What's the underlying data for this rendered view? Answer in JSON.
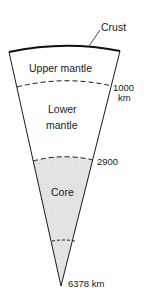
{
  "diagram": {
    "layers": [
      {
        "name": "Crust",
        "label": "Crust"
      },
      {
        "name": "Upper mantle",
        "label": "Upper mantle"
      },
      {
        "name": "Lower mantle",
        "label_line1": "Lower",
        "label_line2": "mantle"
      },
      {
        "name": "Core",
        "label": "Core"
      }
    ],
    "depths": {
      "d1000_value": "1000",
      "d1000_unit": "km",
      "d2900_value": "2900",
      "center_value": "6378 km"
    },
    "colors": {
      "line": "#1a1a1a",
      "core_fill": "#e4e4e4",
      "background": "#ffffff"
    }
  }
}
